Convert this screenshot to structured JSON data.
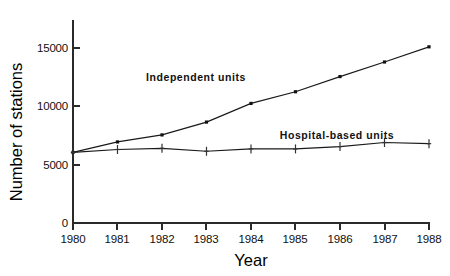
{
  "chart_data": {
    "type": "line",
    "title": "",
    "xlabel": "Year",
    "ylabel": "Number of stations",
    "categories": [
      "1980",
      "1981",
      "1982",
      "1983",
      "1984",
      "1985",
      "1986",
      "1987",
      "1988"
    ],
    "x": [
      1980,
      1981,
      1982,
      1983,
      1984,
      1985,
      1986,
      1987,
      1988
    ],
    "xlim": [
      1980,
      1988
    ],
    "ylim": [
      0,
      16300
    ],
    "yticks": [
      0,
      5000,
      10000,
      15000
    ],
    "ytick_labels": [
      "0",
      "5000",
      "10000",
      "15000"
    ],
    "grid": false,
    "legend_position": "inline-annotation",
    "series": [
      {
        "name": "Independent units",
        "marker": "square",
        "annotation": "Independent units",
        "values": [
          6050,
          6950,
          7550,
          8650,
          10250,
          11250,
          12550,
          13800,
          15100
        ]
      },
      {
        "name": "Hospital-based units",
        "marker": "plus",
        "annotation": "Hospital-based units",
        "values": [
          6050,
          6300,
          6400,
          6150,
          6350,
          6350,
          6550,
          6900,
          6800
        ]
      }
    ]
  },
  "axes": {
    "y_axis_title": "Number of stations",
    "x_axis_title": "Year"
  },
  "colors": {
    "line": "#1a1a1a",
    "axis": "#2a2a2a",
    "background": "#ffffff"
  }
}
